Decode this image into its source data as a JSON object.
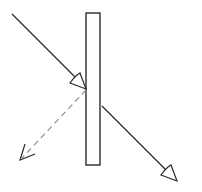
{
  "diagram": {
    "type": "optics-refraction-slab",
    "colors": {
      "background": "#ffffff",
      "stroke": "#2b2b2b",
      "dashed": "#8a8a8a",
      "slab_fill": "#ffffff"
    },
    "slab": {
      "x": 86,
      "y": 13,
      "width": 14,
      "height": 152
    },
    "rays": [
      {
        "name": "incident",
        "style": "solid",
        "from": [
          12,
          14
        ],
        "to": [
          86,
          89
        ],
        "arrow_at": [
          84,
          87
        ]
      },
      {
        "name": "reflected",
        "style": "dashed",
        "from": [
          86,
          89
        ],
        "to": [
          21,
          160
        ],
        "arrow_at": [
          21,
          160
        ]
      },
      {
        "name": "transmitted",
        "style": "solid",
        "from": [
          102,
          106
        ],
        "to": [
          176,
          180
        ],
        "arrow_at": [
          176,
          180
        ]
      }
    ],
    "labels": []
  }
}
